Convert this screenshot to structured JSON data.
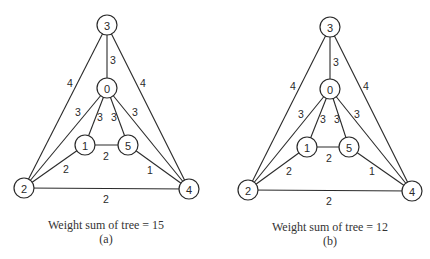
{
  "graphs": [
    {
      "id": "a",
      "caption": "Weight sum of tree = 15",
      "sublabel": "(a)",
      "caption_pos": [
        106,
        229
      ],
      "sublabel_pos": [
        106,
        243
      ],
      "nodes": [
        {
          "id": "3",
          "x": 107,
          "y": 25
        },
        {
          "id": "0",
          "x": 107,
          "y": 88
        },
        {
          "id": "1",
          "x": 85,
          "y": 145
        },
        {
          "id": "5",
          "x": 128,
          "y": 145
        },
        {
          "id": "2",
          "x": 24,
          "y": 188
        },
        {
          "id": "4",
          "x": 189,
          "y": 189
        }
      ],
      "edges": [
        {
          "from": "3",
          "to": "0",
          "weight": "3",
          "lx": 113,
          "ly": 60
        },
        {
          "from": "3",
          "to": "2",
          "weight": "4",
          "lx": 70,
          "ly": 83
        },
        {
          "from": "3",
          "to": "4",
          "weight": "4",
          "lx": 143,
          "ly": 83
        },
        {
          "from": "0",
          "to": "2",
          "weight": "3",
          "lx": 78,
          "ly": 112
        },
        {
          "from": "0",
          "to": "1",
          "weight": "3",
          "lx": 100,
          "ly": 117
        },
        {
          "from": "0",
          "to": "5",
          "weight": "3",
          "lx": 114,
          "ly": 117
        },
        {
          "from": "0",
          "to": "4",
          "weight": "3",
          "lx": 135,
          "ly": 112
        },
        {
          "from": "1",
          "to": "5",
          "weight": "2",
          "lx": 106,
          "ly": 156
        },
        {
          "from": "1",
          "to": "2",
          "weight": "2",
          "lx": 66,
          "ly": 169
        },
        {
          "from": "5",
          "to": "4",
          "weight": "1",
          "lx": 150,
          "ly": 170
        },
        {
          "from": "2",
          "to": "4",
          "weight": "2",
          "lx": 106,
          "ly": 199
        }
      ]
    },
    {
      "id": "b",
      "caption": "Weight sum of tree = 12",
      "sublabel": "(b)",
      "caption_pos": [
        330,
        231
      ],
      "sublabel_pos": [
        330,
        245
      ],
      "nodes": [
        {
          "id": "3",
          "x": 330,
          "y": 27
        },
        {
          "id": "0",
          "x": 330,
          "y": 89
        },
        {
          "id": "1",
          "x": 307,
          "y": 147
        },
        {
          "id": "5",
          "x": 349,
          "y": 147
        },
        {
          "id": "2",
          "x": 248,
          "y": 190
        },
        {
          "id": "4",
          "x": 412,
          "y": 191
        }
      ],
      "edges": [
        {
          "from": "3",
          "to": "0",
          "weight": "3",
          "lx": 336,
          "ly": 62
        },
        {
          "from": "3",
          "to": "2",
          "weight": "4",
          "lx": 293,
          "ly": 86
        },
        {
          "from": "3",
          "to": "4",
          "weight": "4",
          "lx": 366,
          "ly": 86
        },
        {
          "from": "0",
          "to": "2",
          "weight": "3",
          "lx": 301,
          "ly": 114
        },
        {
          "from": "0",
          "to": "1",
          "weight": "3",
          "lx": 323,
          "ly": 119
        },
        {
          "from": "0",
          "to": "5",
          "weight": "3",
          "lx": 337,
          "ly": 119
        },
        {
          "from": "0",
          "to": "4",
          "weight": "3",
          "lx": 357,
          "ly": 114
        },
        {
          "from": "1",
          "to": "5",
          "weight": "2",
          "lx": 329,
          "ly": 158
        },
        {
          "from": "1",
          "to": "2",
          "weight": "2",
          "lx": 289,
          "ly": 171
        },
        {
          "from": "5",
          "to": "4",
          "weight": "1",
          "lx": 372,
          "ly": 171
        },
        {
          "from": "2",
          "to": "4",
          "weight": "2",
          "lx": 329,
          "ly": 201
        }
      ]
    }
  ]
}
